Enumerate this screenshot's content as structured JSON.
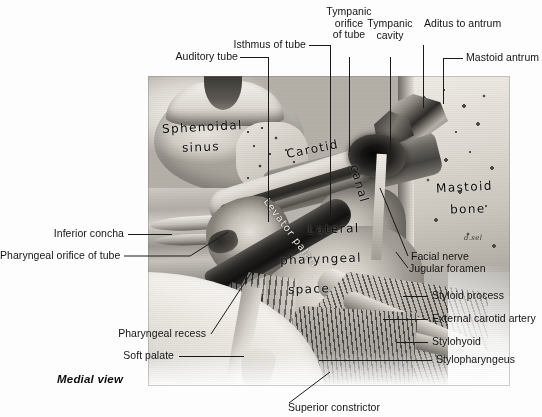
{
  "figure": {
    "caption": "Medial view",
    "signature": "d.sel"
  },
  "labels_top": [
    {
      "id": "auditory-tube",
      "text": "Auditory tube"
    },
    {
      "id": "isthmus-of-tube",
      "text": "Isthmus of tube"
    },
    {
      "id": "tympanic-orifice-of-tube",
      "line1": "Tympanic",
      "line2": "orifice",
      "line3": "of tube"
    },
    {
      "id": "tympanic-cavity",
      "line1": "Tympanic",
      "line2": "cavity"
    },
    {
      "id": "aditus-to-antrum",
      "text": "Aditus to antrum"
    },
    {
      "id": "mastoid-antrum",
      "text": "Mastoid antrum"
    }
  ],
  "labels_left": [
    {
      "id": "inferior-concha",
      "text": "Inferior concha"
    },
    {
      "id": "pharyngeal-orifice-of-tube",
      "text": "Pharyngeal orifice of tube"
    },
    {
      "id": "pharyngeal-recess",
      "text": "Pharyngeal recess"
    },
    {
      "id": "soft-palate",
      "text": "Soft palate"
    }
  ],
  "labels_right": [
    {
      "id": "facial-nerve",
      "text": "Facial nerve"
    },
    {
      "id": "jugular-foramen",
      "text": "Jugular foramen"
    },
    {
      "id": "styloid-process",
      "text": "Styloid process"
    },
    {
      "id": "external-carotid-artery",
      "text": "External carotid artery"
    },
    {
      "id": "stylohyoid",
      "text": "Stylohyoid"
    },
    {
      "id": "stylopharyngeus",
      "text": "Stylopharyngeus"
    }
  ],
  "labels_bottom": [
    {
      "id": "superior-constrictor",
      "text": "Superior constrictor"
    }
  ],
  "plate_annotations": [
    {
      "id": "sphenoidal-sinus-line1",
      "text": "Sphenoidal"
    },
    {
      "id": "sphenoidal-sinus-line2",
      "text": "sinus"
    },
    {
      "id": "carotid",
      "text": "Carotid"
    },
    {
      "id": "canal",
      "text": "canal"
    },
    {
      "id": "levator-palati",
      "text": "Levator palati"
    },
    {
      "id": "lateral",
      "text": "Lateral"
    },
    {
      "id": "pharyngeal",
      "text": "pharyngeal"
    },
    {
      "id": "space",
      "text": "space"
    },
    {
      "id": "mastoid",
      "text": "Mastoid"
    },
    {
      "id": "bone",
      "text": "bone"
    }
  ],
  "colors": {
    "background": "#ffffff",
    "text": "#141414",
    "leader_line": "#1a1a1a"
  }
}
